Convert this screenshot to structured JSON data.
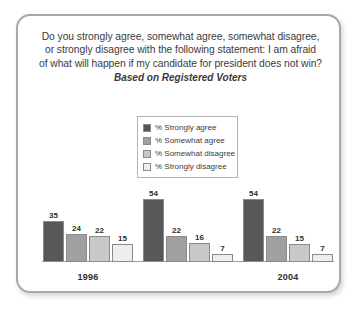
{
  "card": {
    "title_lines": [
      "Do you strongly agree, somewhat agree, somewhat disagree,",
      "or strongly disagree with the following statement: I am afraid",
      "of what will happen if my candidate for president does not win?"
    ],
    "subtitle": "Based on Registered Voters"
  },
  "legend": {
    "items": [
      {
        "label": "% Strongly agree",
        "color": "#585858"
      },
      {
        "label": "% Somewhat agree",
        "color": "#a0a0a0"
      },
      {
        "label": "% Somewhat disagree",
        "color": "#c8c8c8"
      },
      {
        "label": "% Strongly disagree",
        "color": "#eeeeee"
      }
    ]
  },
  "chart_data": {
    "type": "bar",
    "title": "Do you strongly agree, somewhat agree, somewhat disagree, or strongly disagree with the following statement: I am afraid of what will happen if my candidate for president does not win?",
    "subtitle": "Based on Registered Voters",
    "xlabel": "",
    "ylabel": "",
    "ylim": [
      0,
      60
    ],
    "grid": false,
    "legend_position": "top-center",
    "categories": [
      "1996",
      "2004",
      "2008"
    ],
    "series": [
      {
        "name": "% Strongly agree",
        "color": "#585858",
        "values": [
          35,
          54,
          54
        ]
      },
      {
        "name": "% Somewhat agree",
        "color": "#a0a0a0",
        "values": [
          24,
          22,
          22
        ]
      },
      {
        "name": "% Somewhat disagree",
        "color": "#c8c8c8",
        "values": [
          22,
          16,
          15
        ]
      },
      {
        "name": "% Strongly disagree",
        "color": "#eeeeee",
        "values": [
          15,
          7,
          7
        ]
      }
    ]
  }
}
